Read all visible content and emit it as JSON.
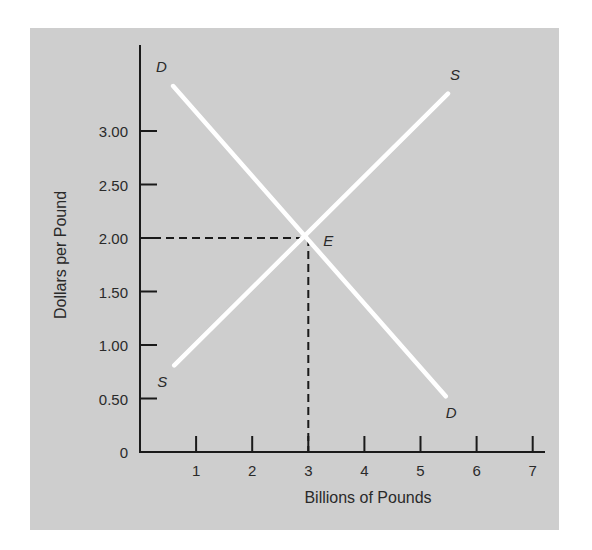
{
  "chart_data": {
    "type": "line",
    "title": "",
    "xlabel": "Billions of Pounds",
    "ylabel": "Dollars per Pound",
    "xlim": [
      0,
      7.3
    ],
    "ylim": [
      0,
      3.8
    ],
    "x_ticks": [
      1,
      2,
      3,
      4,
      5,
      6,
      7
    ],
    "x_tick_labels": [
      "1",
      "2",
      "3",
      "4",
      "5",
      "6",
      "7"
    ],
    "y_ticks": [
      0,
      0.5,
      1.0,
      1.5,
      2.0,
      2.5,
      3.0
    ],
    "y_tick_labels": [
      "0",
      "0.50",
      "1.00",
      "1.50",
      "2.00",
      "2.50",
      "3.00"
    ],
    "grid": false,
    "series": [
      {
        "name": "D",
        "label_start": "D",
        "label_end": "D",
        "color": "#ffffff",
        "points": [
          [
            0.59,
            3.42
          ],
          [
            5.45,
            0.52
          ]
        ]
      },
      {
        "name": "S",
        "label_start": "S",
        "label_end": "S",
        "color": "#ffffff",
        "points": [
          [
            0.61,
            0.81
          ],
          [
            5.49,
            3.35
          ]
        ]
      }
    ],
    "annotations": [
      {
        "label": "E",
        "type": "equilibrium-point",
        "x": 3,
        "y": 2.0,
        "dashed_guides": true
      }
    ],
    "background": "#cecece"
  }
}
